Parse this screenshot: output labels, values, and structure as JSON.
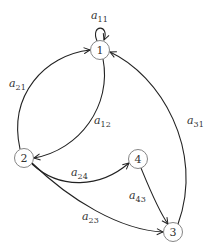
{
  "diagram": {
    "type": "directed-graph",
    "nodes": [
      {
        "id": "1",
        "label": "1",
        "x": 100,
        "y": 50
      },
      {
        "id": "2",
        "label": "2",
        "x": 24,
        "y": 158
      },
      {
        "id": "3",
        "label": "3",
        "x": 173,
        "y": 232
      },
      {
        "id": "4",
        "label": "4",
        "x": 138,
        "y": 159
      }
    ],
    "edges": [
      {
        "from": "1",
        "to": "1",
        "label": "a",
        "sub": "11"
      },
      {
        "from": "2",
        "to": "1",
        "label": "a",
        "sub": "21"
      },
      {
        "from": "1",
        "to": "2",
        "label": "a",
        "sub": "12"
      },
      {
        "from": "3",
        "to": "1",
        "label": "a",
        "sub": "31"
      },
      {
        "from": "2",
        "to": "4",
        "label": "a",
        "sub": "24"
      },
      {
        "from": "4",
        "to": "3",
        "label": "a",
        "sub": "43"
      },
      {
        "from": "2",
        "to": "3",
        "label": "a",
        "sub": "23"
      }
    ]
  }
}
